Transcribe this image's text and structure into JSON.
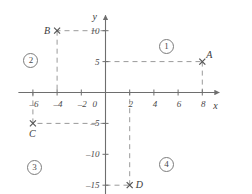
{
  "figure": {
    "kind": "cartesian-coordinate-plane",
    "axes": {
      "x_name": "x",
      "y_name": "y",
      "origin_label": "0",
      "x_ticks": [
        -6,
        -4,
        -2,
        2,
        4,
        6,
        8
      ],
      "x_tick_labels": [
        "–6",
        "–4",
        "–2",
        "2",
        "4",
        "6",
        "8"
      ],
      "y_ticks": [
        10,
        5,
        -5,
        -10,
        -15
      ],
      "y_tick_labels": [
        "10",
        "5",
        "–5",
        "–10",
        "–15"
      ],
      "x_range": [
        -7.2,
        9.4
      ],
      "y_range": [
        -17.5,
        12.5
      ]
    },
    "points": [
      {
        "id": "A",
        "label": "A",
        "x": 8,
        "y": 5,
        "label_dx": 4,
        "label_dy": -12
      },
      {
        "id": "B",
        "label": "B",
        "x": -4,
        "y": 10,
        "label_dx": -13,
        "label_dy": -5
      },
      {
        "id": "C",
        "label": "C",
        "x": -6,
        "y": -5,
        "label_dx": -4,
        "label_dy": 6
      },
      {
        "id": "D",
        "label": "D",
        "x": 2,
        "y": -15,
        "label_dx": 6,
        "label_dy": -5
      }
    ],
    "guides": [
      {
        "from": "y-axis",
        "to": "A",
        "kind": "horizontal",
        "x_from": 0,
        "x_to": 8,
        "y": 5
      },
      {
        "from": "A",
        "to": "x-axis",
        "kind": "vertical",
        "x": 8,
        "y_from": 5,
        "y_to": 0
      },
      {
        "from": "y-axis",
        "to": "B",
        "kind": "horizontal",
        "x_from": 0,
        "x_to": -4,
        "y": 10
      },
      {
        "from": "B",
        "to": "x-axis",
        "kind": "vertical",
        "x": -4,
        "y_from": 10,
        "y_to": 0
      },
      {
        "from": "y-axis",
        "to": "C",
        "kind": "horizontal",
        "x_from": 0,
        "x_to": -6,
        "y": -5
      },
      {
        "from": "C",
        "to": "x-axis",
        "kind": "vertical",
        "x": -6,
        "y_from": -5,
        "y_to": 0
      },
      {
        "from": "y-axis",
        "to": "D",
        "kind": "horizontal",
        "x_from": 0,
        "x_to": 2,
        "y": -15
      },
      {
        "from": "D",
        "to": "x-axis",
        "kind": "vertical",
        "x": 2,
        "y_from": -15,
        "y_to": 0
      }
    ],
    "quadrant_labels": [
      {
        "id": "q1",
        "text": "1",
        "x": 5.0,
        "y": 7.6
      },
      {
        "id": "q2",
        "text": "2",
        "x": -6.2,
        "y": 5.2
      },
      {
        "id": "q3",
        "text": "3",
        "x": -5.9,
        "y": -12.0
      },
      {
        "id": "q4",
        "text": "4",
        "x": 5.0,
        "y": -11.6
      }
    ],
    "style": {
      "axis_color": "#6e6e6e",
      "guide_color": "#9a9a9a",
      "marker_color": "#555555",
      "text_color": "#3b3b3b",
      "background": "#ffffff"
    }
  }
}
